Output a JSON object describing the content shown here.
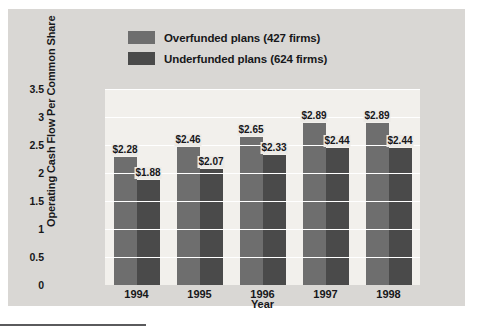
{
  "chart_data": {
    "type": "bar",
    "title": "",
    "xlabel": "Year",
    "ylabel": "Operating Cash Flow Per Common Share",
    "categories": [
      "1994",
      "1995",
      "1996",
      "1997",
      "1998"
    ],
    "ylim": [
      0,
      3.5
    ],
    "yticks": [
      "0",
      "0.5",
      "1",
      "1.5",
      "2",
      "2.5",
      "3",
      "3.5"
    ],
    "ytick_values": [
      0,
      0.5,
      1,
      1.5,
      2,
      2.5,
      3,
      3.5
    ],
    "grid": true,
    "legend_position": "top-center",
    "series": [
      {
        "name": "Overfunded plans (427 firms)",
        "color": "#6e6e6e",
        "values": [
          2.28,
          2.46,
          2.65,
          2.89,
          2.89
        ],
        "labels": [
          "$2.28",
          "$2.46",
          "$2.65",
          "$2.89",
          "$2.89"
        ]
      },
      {
        "name": "Underfunded plans (624 firms)",
        "color": "#4a4a4a",
        "values": [
          1.88,
          2.07,
          2.33,
          2.44,
          2.44
        ],
        "labels": [
          "$1.88",
          "$2.07",
          "$2.33",
          "$2.44",
          "$2.44"
        ]
      }
    ]
  },
  "colors": {
    "page_background": "#ffffff",
    "card_background": "#d9d7d4",
    "plot_background": "#f2f0ec",
    "gridline": "#ffffff",
    "text": "#17171a",
    "rule": "#5a5a5c"
  }
}
